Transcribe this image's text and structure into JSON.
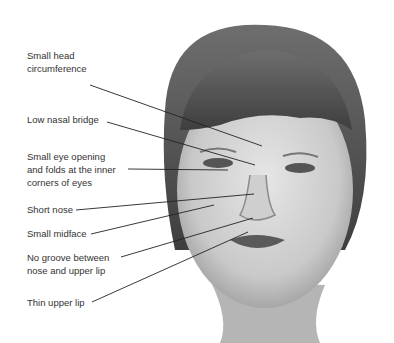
{
  "figure": {
    "labels": [
      {
        "id": "head",
        "text": "Small head\ncircumference",
        "top": 49
      },
      {
        "id": "nasal-bridge",
        "text": "Low nasal bridge",
        "top": 113
      },
      {
        "id": "eye-opening",
        "text": "Small eye opening\nand folds at the inner\ncorners of eyes",
        "top": 150
      },
      {
        "id": "short-nose",
        "text": "Short nose",
        "top": 203
      },
      {
        "id": "midface",
        "text": "Small midface",
        "top": 227
      },
      {
        "id": "groove",
        "text": "No groove between\nnose and upper lip",
        "top": 251
      },
      {
        "id": "upper-lip",
        "text": "Thin upper lip",
        "top": 296
      }
    ]
  }
}
